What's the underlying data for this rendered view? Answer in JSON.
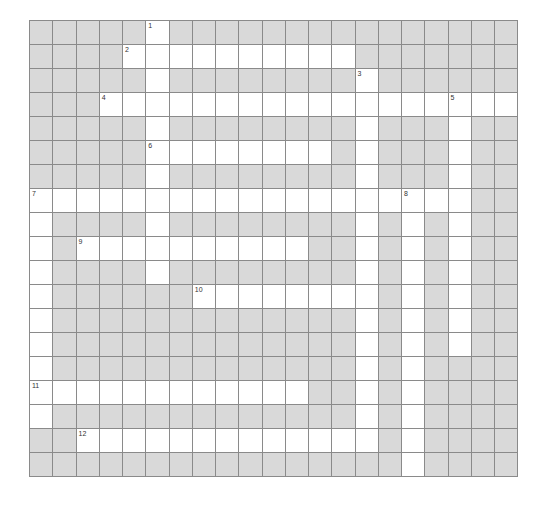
{
  "puzzle": {
    "cols": 21,
    "rows": 19,
    "colors": {
      "block": "#d9d9d9",
      "open": "#ffffff",
      "grid_line": "#8a8a8a",
      "number": "#333333"
    },
    "entries": [
      {
        "number": "1",
        "direction": "down",
        "row": 0,
        "col": 5,
        "length": 11
      },
      {
        "number": "2",
        "direction": "across",
        "row": 1,
        "col": 4,
        "length": 10
      },
      {
        "number": "3",
        "direction": "down",
        "row": 2,
        "col": 14,
        "length": 16
      },
      {
        "number": "4",
        "direction": "across",
        "row": 3,
        "col": 3,
        "length": 18
      },
      {
        "number": "5",
        "direction": "down",
        "row": 3,
        "col": 18,
        "length": 11
      },
      {
        "number": "6",
        "direction": "across",
        "row": 5,
        "col": 5,
        "length": 8
      },
      {
        "number": "7",
        "direction": "across",
        "row": 7,
        "col": 0,
        "length": 19
      },
      {
        "number": "7",
        "direction": "down",
        "row": 7,
        "col": 0,
        "length": 10
      },
      {
        "number": "8",
        "direction": "down",
        "row": 7,
        "col": 16,
        "length": 12
      },
      {
        "number": "9",
        "direction": "across",
        "row": 9,
        "col": 2,
        "length": 10
      },
      {
        "number": "10",
        "direction": "across",
        "row": 11,
        "col": 7,
        "length": 8
      },
      {
        "number": "11",
        "direction": "across",
        "row": 15,
        "col": 0,
        "length": 12
      },
      {
        "number": "12",
        "direction": "across",
        "row": 17,
        "col": 2,
        "length": 13
      }
    ]
  }
}
